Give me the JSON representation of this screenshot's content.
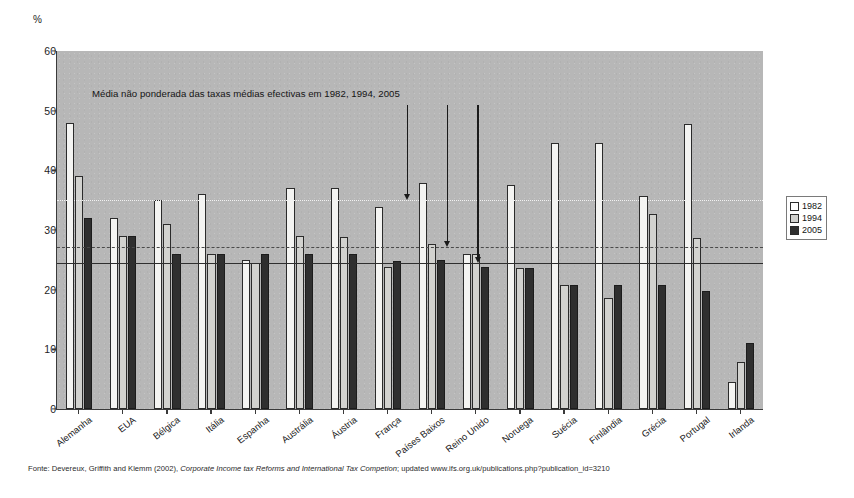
{
  "figure": {
    "y_unit_label": "%",
    "annotation": "Média não ponderada das taxas médias efectivas em  1982,  1994,   2005",
    "source_prefix": "Fonte: Devereux, Griffith and Klemm (2002), ",
    "source_italic": "Corporate Income tax Reforms and International Tax Competion",
    "source_suffix": "; updated www.ifs.org.uk/publications.php?publication_id=3210"
  },
  "legend": {
    "position": "right",
    "entries": [
      {
        "label": "1982",
        "color": "#ffffff"
      },
      {
        "label": "1994",
        "color": "#d2d2cf"
      },
      {
        "label": "2005",
        "color": "#2f2f2f"
      }
    ]
  },
  "chart_data": {
    "type": "bar",
    "title": "",
    "xlabel": "",
    "ylabel": "%",
    "ylim": [
      0,
      60
    ],
    "yticks": [
      0,
      10,
      20,
      30,
      40,
      50,
      60
    ],
    "grid": false,
    "categories": [
      "Alemanha",
      "EUA",
      "Bélgica",
      "Itália",
      "Espanha",
      "Austrália",
      "Áustria",
      "França",
      "Países Baixos",
      "Reino Unido",
      "Noruega",
      "Suécia",
      "Finlândia",
      "Grécia",
      "Portugal",
      "Irlanda"
    ],
    "series": [
      {
        "name": "1982",
        "color": "#f4f4f2",
        "values": [
          48.0,
          32.0,
          35.0,
          36.0,
          25.0,
          37.0,
          37.0,
          33.8,
          37.8,
          26.0,
          37.6,
          44.6,
          44.6,
          35.7,
          47.8,
          4.5
        ]
      },
      {
        "name": "1994",
        "color": "#d2d2cf",
        "values": [
          39.0,
          29.0,
          31.0,
          26.0,
          24.5,
          29.0,
          28.8,
          23.8,
          27.6,
          26.0,
          23.7,
          20.8,
          18.6,
          32.7,
          28.7,
          7.8
        ]
      },
      {
        "name": "2005",
        "color": "#2f2f2f",
        "values": [
          32.0,
          29.0,
          26.0,
          26.0,
          26.0,
          26.0,
          26.0,
          24.8,
          25.0,
          23.8,
          23.7,
          20.8,
          20.8,
          20.8,
          19.8,
          11.0
        ]
      }
    ],
    "reference_lines": [
      {
        "name": "1982",
        "value": 35.0,
        "style": "dotted",
        "color": "#f2f2f2"
      },
      {
        "name": "1994",
        "value": 27.2,
        "style": "dashed",
        "color": "#4a4a4a"
      },
      {
        "name": "2005",
        "value": 24.5,
        "style": "solid",
        "color": "#2e2e2e"
      }
    ],
    "annotation_arrows": [
      {
        "points_to": "1982",
        "x_value": 7.45,
        "top_value": 51.0
      },
      {
        "points_to": "1994",
        "x_value": 8.35,
        "top_value": 51.0
      },
      {
        "points_to": "2005",
        "x_value": 9.05,
        "top_value": 51.0
      }
    ]
  }
}
